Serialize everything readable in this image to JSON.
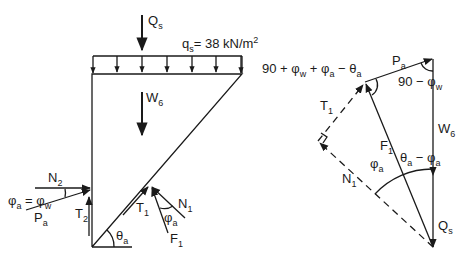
{
  "figure": {
    "wedge": {
      "surcharge_point": {
        "symbol": "Q",
        "sub": "s"
      },
      "distributed_load": {
        "symbol": "q",
        "sub": "s",
        "value": "= 38 kN/m",
        "sup": "2"
      },
      "weight": {
        "symbol": "W",
        "sub": "6"
      },
      "wall_normal": {
        "symbol": "N",
        "sub": "2"
      },
      "wall_friction_angle": {
        "lhs": "φ",
        "lhs_sub": "a",
        "eq": " = ",
        "rhs": "φ",
        "rhs_sub": "w"
      },
      "active_force": {
        "symbol": "P",
        "sub": "a"
      },
      "wall_shear": {
        "symbol": "T",
        "sub": "2"
      },
      "slip_shear": {
        "symbol": "T",
        "sub": "1"
      },
      "slip_normal": {
        "symbol": "N",
        "sub": "1"
      },
      "slip_friction_angle": {
        "symbol": "φ",
        "sub": "a"
      },
      "slip_resultant": {
        "symbol": "F",
        "sub": "1"
      },
      "slip_plane_angle": {
        "symbol": "θ",
        "sub": "a"
      }
    },
    "force_polygon": {
      "angle_top_left": {
        "text1": "90 + φ",
        "sub1": "w",
        "text2": " + φ",
        "sub2": "a",
        "text3": " − θ",
        "sub3": "a"
      },
      "angle_top_right": {
        "text1": "90 − φ",
        "sub1": "w"
      },
      "active_force": {
        "symbol": "P",
        "sub": "a"
      },
      "weight": {
        "symbol": "W",
        "sub": "6"
      },
      "surcharge": {
        "symbol": "Q",
        "sub": "s"
      },
      "slip_shear": {
        "symbol": "T",
        "sub": "1"
      },
      "slip_resultant": {
        "symbol": "F",
        "sub": "1"
      },
      "slip_normal": {
        "symbol": "N",
        "sub": "1"
      },
      "friction_angle": {
        "symbol": "φ",
        "sub": "a"
      },
      "angle_bottom": {
        "text1": "θ",
        "sub1": "a",
        "text2": " − φ",
        "sub2": "a"
      }
    }
  }
}
